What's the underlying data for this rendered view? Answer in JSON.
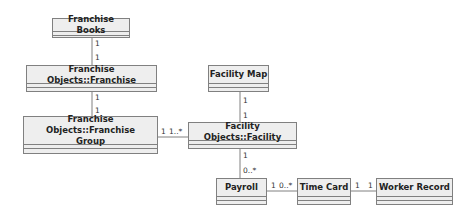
{
  "classes": {
    "franchise_books": {
      "name": "Franchise Books"
    },
    "franchise": {
      "name": "Franchise Objects::Franchise"
    },
    "franchise_group": {
      "name": "Franchise Objects::Franchise Group"
    },
    "facility_map": {
      "name": "Facility Map"
    },
    "facility": {
      "name": "Facility Objects::Facility"
    },
    "payroll": {
      "name": "Payroll"
    },
    "time_card": {
      "name": "Time Card"
    },
    "worker_record": {
      "name": "Worker Record"
    }
  },
  "associations": [
    {
      "from": "Franchise Books",
      "to": "Franchise Objects::Franchise",
      "from_mult": "1",
      "to_mult": "1"
    },
    {
      "from": "Franchise Objects::Franchise",
      "to": "Franchise Objects::Franchise Group",
      "from_mult": "1",
      "to_mult": "1"
    },
    {
      "from": "Franchise Objects::Franchise Group",
      "to": "Facility Objects::Facility",
      "from_mult": "1",
      "to_mult": "1..*"
    },
    {
      "from": "Facility Map",
      "to": "Facility Objects::Facility",
      "from_mult": "1",
      "to_mult": "1"
    },
    {
      "from": "Facility Objects::Facility",
      "to": "Payroll",
      "from_mult": "1",
      "to_mult": "0..*"
    },
    {
      "from": "Payroll",
      "to": "Time Card",
      "from_mult": "1",
      "to_mult": "0..*"
    },
    {
      "from": "Time Card",
      "to": "Worker Record",
      "from_mult": "1",
      "to_mult": "1"
    }
  ]
}
